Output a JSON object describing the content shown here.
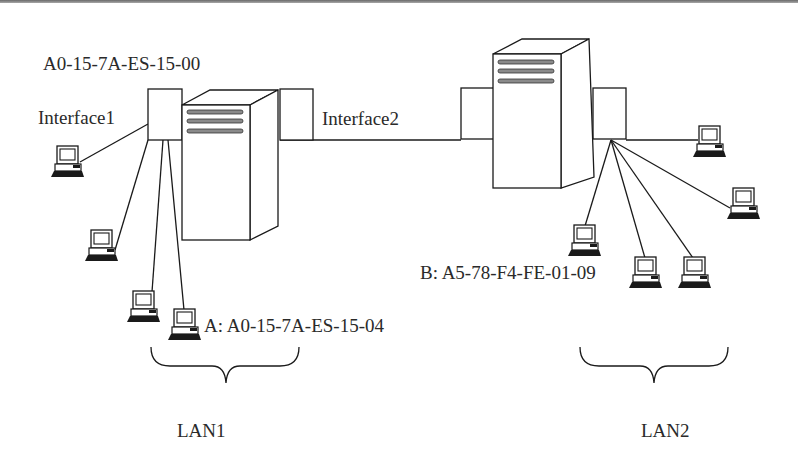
{
  "diagram": {
    "type": "network-topology",
    "colors": {
      "line": "#1a1a1a",
      "slat": "#8a8a8a",
      "background": "#ffffff",
      "text": "#2a2a2a"
    },
    "labels": {
      "router1_interface1_mac": "A0-15-7A-ES-15-00",
      "interface1": "Interface1",
      "interface2": "Interface2",
      "host_a": "A: A0-15-7A-ES-15-04",
      "host_b": "B: A5-78-F4-FE-01-09",
      "lan1": "LAN1",
      "lan2": "LAN2"
    },
    "nodes": [
      {
        "id": "router1",
        "icon": "server-tower-icon"
      },
      {
        "id": "router2",
        "icon": "server-tower-icon"
      },
      {
        "id": "lan1-host-1",
        "icon": "desktop-computer-icon",
        "lan": "LAN1"
      },
      {
        "id": "lan1-host-2",
        "icon": "desktop-computer-icon",
        "lan": "LAN1"
      },
      {
        "id": "lan1-host-3",
        "icon": "desktop-computer-icon",
        "lan": "LAN1"
      },
      {
        "id": "lan1-host-A",
        "icon": "desktop-computer-icon",
        "lan": "LAN1",
        "label": "A: A0-15-7A-ES-15-04"
      },
      {
        "id": "lan2-host-B",
        "icon": "desktop-computer-icon",
        "lan": "LAN2",
        "label": "B: A5-78-F4-FE-01-09"
      },
      {
        "id": "lan2-host-2",
        "icon": "desktop-computer-icon",
        "lan": "LAN2"
      },
      {
        "id": "lan2-host-3",
        "icon": "desktop-computer-icon",
        "lan": "LAN2"
      },
      {
        "id": "lan2-host-4",
        "icon": "desktop-computer-icon",
        "lan": "LAN2"
      },
      {
        "id": "lan2-host-5",
        "icon": "desktop-computer-icon",
        "lan": "LAN2"
      }
    ],
    "links": [
      {
        "from": "router1.interface2",
        "to": "router2.interface"
      },
      {
        "from": "router1.interface1",
        "to": "lan1-host-1"
      },
      {
        "from": "router1.interface1",
        "to": "lan1-host-2"
      },
      {
        "from": "router1.interface1",
        "to": "lan1-host-3"
      },
      {
        "from": "router1.interface1",
        "to": "lan1-host-A"
      },
      {
        "from": "router2.interface",
        "to": "lan2-host-B"
      },
      {
        "from": "router2.interface",
        "to": "lan2-host-2"
      },
      {
        "from": "router2.interface",
        "to": "lan2-host-3"
      },
      {
        "from": "router2.interface",
        "to": "lan2-host-4"
      },
      {
        "from": "router2.interface",
        "to": "lan2-host-5"
      }
    ]
  }
}
